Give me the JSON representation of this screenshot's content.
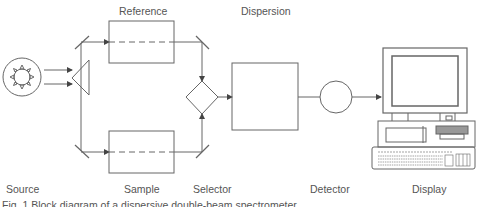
{
  "labels": {
    "reference": "Reference",
    "dispersion": "Dispersion",
    "source": "Source",
    "sample": "Sample",
    "selector": "Selector",
    "detector": "Detector",
    "display": "Display"
  },
  "caption": "Fig. 1  Block diagram of a dispersive double-beam spectrometer",
  "colors": {
    "line": "#555555",
    "text": "#555555",
    "background": "#ffffff"
  }
}
